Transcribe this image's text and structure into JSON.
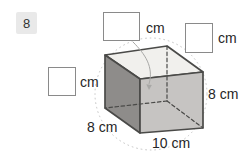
{
  "question": {
    "number": "8"
  },
  "figure": {
    "solid": "cuboid",
    "dimensions": {
      "depth_label": "8 cm",
      "width_label": "10 cm",
      "height_label": "8 cm"
    },
    "colors": {
      "face_top": "#f1f0ed",
      "face_left": "#8e8c8a",
      "face_front": "#c6c4c2",
      "edge": "#4a4a48",
      "circle": "#c4c4c4",
      "leader": "#a8a8a6",
      "badge_bg": "#e9e9e9",
      "box_border": "#8a8a8a",
      "text": "#262626"
    }
  },
  "answer_boxes": [
    {
      "position": "top",
      "value": "",
      "unit_label": "cm"
    },
    {
      "position": "top-right",
      "value": "",
      "unit_label": "cm"
    },
    {
      "position": "left",
      "value": "",
      "unit_label": "cm"
    }
  ]
}
